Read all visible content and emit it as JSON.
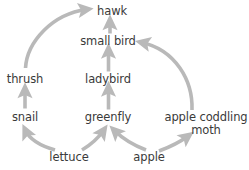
{
  "diagram": {
    "type": "food-web",
    "title": "",
    "background_color": "#ffffff",
    "arrow_color": "#b9b9b9",
    "text_color": "#3a3a3a",
    "nodes": [
      {
        "id": "hawk",
        "label": "hawk",
        "cx": 112,
        "cy": 11,
        "lines": 1
      },
      {
        "id": "small_bird",
        "label": "small bird",
        "cx": 108,
        "cy": 41,
        "lines": 1
      },
      {
        "id": "thrush",
        "label": "thrush",
        "cx": 25,
        "cy": 79,
        "lines": 1
      },
      {
        "id": "ladybird",
        "label": "ladybird",
        "cx": 108,
        "cy": 79,
        "lines": 1
      },
      {
        "id": "snail",
        "label": "snail",
        "cx": 25,
        "cy": 117,
        "lines": 1
      },
      {
        "id": "greenfly",
        "label": "greenfly",
        "cx": 108,
        "cy": 117,
        "lines": 1
      },
      {
        "id": "moth",
        "label": "apple coddling\nmoth",
        "cx": 206,
        "cy": 124,
        "lines": 2
      },
      {
        "id": "lettuce",
        "label": "lettuce",
        "cx": 69,
        "cy": 157,
        "lines": 1
      },
      {
        "id": "apple",
        "label": "apple",
        "cx": 149,
        "cy": 157,
        "lines": 1
      }
    ],
    "edges": [
      {
        "from": "thrush",
        "to": "hawk",
        "shape": "curve-right"
      },
      {
        "from": "small_bird",
        "to": "hawk",
        "shape": "straight-up"
      },
      {
        "from": "ladybird",
        "to": "small_bird",
        "shape": "straight-up"
      },
      {
        "from": "greenfly",
        "to": "ladybird",
        "shape": "straight-up"
      },
      {
        "from": "snail",
        "to": "thrush",
        "shape": "straight-up"
      },
      {
        "from": "lettuce",
        "to": "snail",
        "shape": "curve-left"
      },
      {
        "from": "lettuce",
        "to": "greenfly",
        "shape": "diagonal-right"
      },
      {
        "from": "apple",
        "to": "greenfly",
        "shape": "diagonal-left"
      },
      {
        "from": "apple",
        "to": "moth",
        "shape": "diagonal-right"
      },
      {
        "from": "moth",
        "to": "small_bird",
        "shape": "curve-left"
      }
    ]
  }
}
